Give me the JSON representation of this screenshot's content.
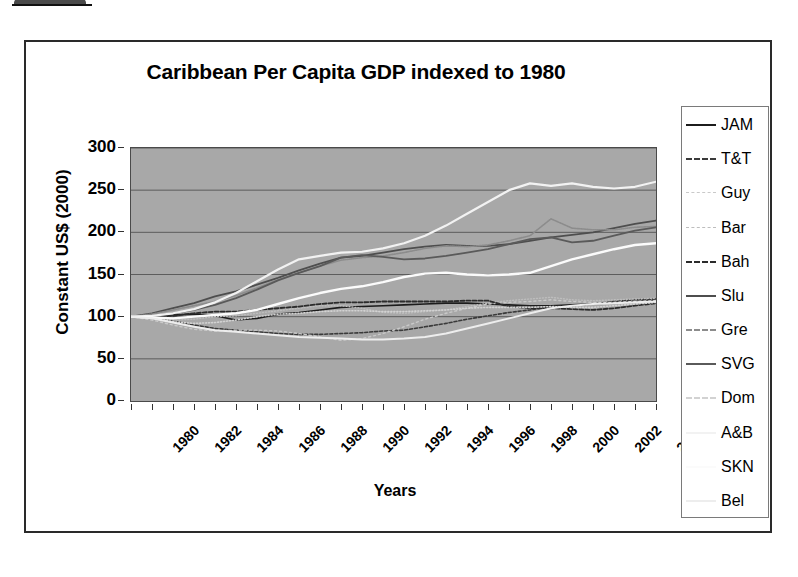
{
  "figure": {
    "title": "Caribbean Per Capita GDP indexed to 1980",
    "x_axis_title": "Years",
    "y_axis_title": "Constant US$ (2000)"
  },
  "axes": {
    "y_ticks": [
      "0",
      "50",
      "100",
      "150",
      "200",
      "250",
      "300"
    ],
    "x_ticks": [
      "1980",
      "1982",
      "1984",
      "1986",
      "1988",
      "1990",
      "1992",
      "1994",
      "1996",
      "1998",
      "2000",
      "2002",
      "2004"
    ]
  },
  "legend": {
    "items": [
      {
        "label": "JAM",
        "color": "#1c1c1c",
        "dash": "none",
        "width": 1.6
      },
      {
        "label": "T&T",
        "color": "#3a3a3a",
        "dash": "3,2",
        "width": 1.6
      },
      {
        "label": "Guy",
        "color": "#c9c9c9",
        "dash": "2,3",
        "width": 1.4
      },
      {
        "label": "Bar",
        "color": "#bdbdbd",
        "dash": "1,2",
        "width": 1.4
      },
      {
        "label": "Bah",
        "color": "#2b2b2b",
        "dash": "4,2",
        "width": 1.8
      },
      {
        "label": "Slu",
        "color": "#4e4e4e",
        "dash": "none",
        "width": 1.8
      },
      {
        "label": "Gre",
        "color": "#8c8c8c",
        "dash": "1,1",
        "width": 1.6
      },
      {
        "label": "SVG",
        "color": "#5a5a5a",
        "dash": "none",
        "width": 1.8
      },
      {
        "label": "Dom",
        "color": "#d2d2d2",
        "dash": "1,2",
        "width": 1.6
      },
      {
        "label": "A&B",
        "color": "#f2f2f2",
        "dash": "none",
        "width": 2.2
      },
      {
        "label": "SKN",
        "color": "#fbfbfb",
        "dash": "none",
        "width": 2.4
      },
      {
        "label": "Bel",
        "color": "#ededed",
        "dash": "none",
        "width": 2.0
      }
    ]
  },
  "chart_data": {
    "type": "line",
    "title": "Caribbean Per Capita GDP indexed to 1980",
    "xlabel": "Years",
    "ylabel": "Constant US$ (2000)",
    "xlim": [
      1980,
      2005
    ],
    "ylim": [
      0,
      300
    ],
    "grid": true,
    "legend_position": "right",
    "x": [
      1980,
      1981,
      1982,
      1983,
      1984,
      1985,
      1986,
      1987,
      1988,
      1989,
      1990,
      1991,
      1992,
      1993,
      1994,
      1995,
      1996,
      1997,
      1998,
      1999,
      2000,
      2001,
      2002,
      2003,
      2004,
      2005
    ],
    "series": [
      {
        "name": "JAM",
        "values": [
          100,
          101,
          102,
          103,
          101,
          96,
          98,
          103,
          105,
          108,
          111,
          112,
          113,
          114,
          115,
          116,
          116,
          115,
          114,
          113,
          113,
          114,
          115,
          117,
          118,
          119
        ]
      },
      {
        "name": "T&T",
        "values": [
          100,
          99,
          95,
          90,
          86,
          84,
          82,
          80,
          79,
          79,
          80,
          81,
          83,
          84,
          88,
          92,
          97,
          101,
          105,
          108,
          112,
          113,
          115,
          118,
          120,
          121
        ]
      },
      {
        "name": "Guy",
        "values": [
          100,
          96,
          90,
          85,
          83,
          84,
          84,
          83,
          80,
          76,
          72,
          74,
          80,
          88,
          97,
          104,
          110,
          115,
          117,
          118,
          120,
          118,
          117,
          117,
          118,
          119
        ]
      },
      {
        "name": "Bar",
        "values": [
          100,
          99,
          96,
          97,
          100,
          101,
          104,
          107,
          110,
          113,
          113,
          110,
          105,
          104,
          106,
          108,
          112,
          116,
          119,
          121,
          123,
          120,
          119,
          120,
          121,
          122
        ]
      },
      {
        "name": "Bah",
        "values": [
          100,
          100,
          101,
          104,
          106,
          106,
          108,
          110,
          112,
          115,
          117,
          117,
          118,
          118,
          118,
          118,
          119,
          119,
          112,
          110,
          110,
          109,
          108,
          110,
          113,
          116
        ]
      },
      {
        "name": "Slu",
        "values": [
          100,
          104,
          110,
          116,
          124,
          130,
          138,
          146,
          155,
          163,
          170,
          172,
          176,
          180,
          183,
          185,
          184,
          184,
          186,
          190,
          194,
          197,
          200,
          205,
          210,
          214
        ]
      },
      {
        "name": "Gre",
        "values": [
          100,
          103,
          108,
          113,
          118,
          125,
          134,
          144,
          152,
          160,
          167,
          170,
          172,
          176,
          181,
          184,
          183,
          185,
          190,
          196,
          216,
          205,
          203,
          203,
          206,
          207
        ]
      },
      {
        "name": "SVG",
        "values": [
          100,
          101,
          104,
          108,
          114,
          122,
          132,
          143,
          152,
          160,
          170,
          173,
          171,
          168,
          169,
          172,
          176,
          180,
          186,
          192,
          194,
          188,
          190,
          196,
          202,
          206
        ]
      },
      {
        "name": "Dom",
        "values": [
          100,
          98,
          94,
          92,
          93,
          96,
          100,
          103,
          104,
          106,
          107,
          107,
          106,
          106,
          107,
          108,
          110,
          111,
          111,
          111,
          112,
          111,
          111,
          113,
          115,
          117
        ]
      },
      {
        "name": "A&B",
        "values": [
          100,
          101,
          104,
          109,
          117,
          128,
          142,
          156,
          168,
          172,
          176,
          177,
          181,
          187,
          196,
          208,
          222,
          236,
          250,
          258,
          255,
          258,
          254,
          252,
          254,
          260
        ]
      },
      {
        "name": "SKN",
        "values": [
          100,
          99,
          98,
          100,
          102,
          104,
          108,
          115,
          122,
          128,
          133,
          136,
          141,
          147,
          151,
          152,
          150,
          149,
          150,
          152,
          160,
          168,
          174,
          180,
          185,
          187
        ]
      },
      {
        "name": "Bel",
        "values": [
          100,
          98,
          93,
          88,
          84,
          82,
          80,
          78,
          76,
          75,
          74,
          73,
          73,
          74,
          76,
          80,
          86,
          92,
          98,
          104,
          110,
          113,
          115,
          116,
          117,
          118
        ]
      }
    ]
  }
}
